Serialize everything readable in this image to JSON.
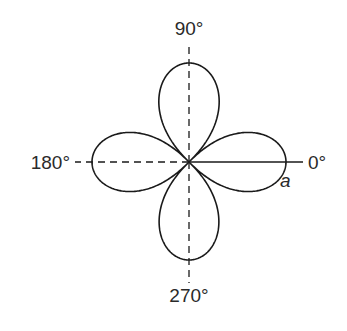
{
  "diagram": {
    "type": "polar-rose",
    "petals": 4,
    "petal_directions_deg": [
      0,
      90,
      180,
      270
    ],
    "amplitude_label": "a",
    "axes": {
      "positive_x": {
        "label": "0°",
        "style": "solid"
      },
      "positive_y": {
        "label": "90°",
        "style": "dashed"
      },
      "negative_x": {
        "label": "180°",
        "style": "dashed"
      },
      "negative_y": {
        "label": "270°",
        "style": "dashed"
      }
    },
    "colors": {
      "stroke": "#1a1a1a",
      "text": "#2a2a2a",
      "background": "#ffffff"
    }
  }
}
